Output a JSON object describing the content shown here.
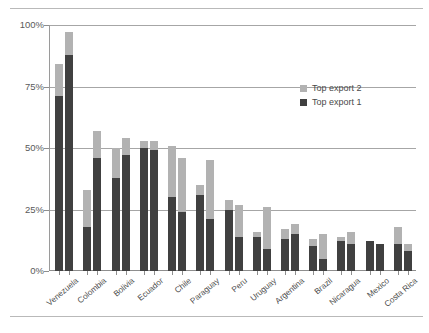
{
  "chart_data": {
    "type": "bar",
    "title": "",
    "subtitle": "",
    "xlabel": "",
    "ylabel": "",
    "ylim": [
      0,
      100
    ],
    "y_tick_labels": [
      "0%",
      "25%",
      "50%",
      "75%",
      "100%"
    ],
    "y_ticks": [
      0,
      25,
      50,
      75,
      100
    ],
    "grid": "horizontal",
    "stacked": true,
    "bars_per_category": 2,
    "legend_position": "inside-top-right",
    "legend": [
      "Top export 2",
      "Top export 1"
    ],
    "colors": {
      "top_export_1": "#404040",
      "top_export_2": "#b2b2b2",
      "gridline": "#a6a6a6",
      "axis": "#8e8e8e",
      "text": "#4a4a4a",
      "background": "#ffffff"
    },
    "categories": [
      "Venezuela",
      "Colombia",
      "Bolivia",
      "Ecuador",
      "Chile",
      "Paraguay",
      "Peru",
      "Uruguay",
      "Argentina",
      "Brazil",
      "Nicaragua",
      "Mexico",
      "Costa Rica"
    ],
    "series": [
      {
        "name": "Top export 1",
        "bar_a": [
          71,
          18,
          38,
          50,
          30,
          31,
          25,
          14,
          13,
          10,
          12,
          12,
          11
        ],
        "bar_b": [
          88,
          46,
          47,
          49,
          24,
          21,
          14,
          9,
          15,
          5,
          11,
          11,
          8
        ]
      },
      {
        "name": "Top export 2",
        "bar_a": [
          13,
          15,
          12,
          3,
          21,
          4,
          4,
          2,
          4,
          3,
          2,
          0,
          7
        ],
        "bar_b": [
          9,
          11,
          7,
          4,
          22,
          24,
          13,
          17,
          4,
          10,
          5,
          0,
          3
        ]
      }
    ],
    "totals": {
      "bar_a": [
        84,
        33,
        50,
        53,
        51,
        35,
        29,
        16,
        17,
        13,
        14,
        12,
        18
      ],
      "bar_b": [
        97,
        57,
        54,
        53,
        46,
        45,
        27,
        26,
        19,
        15,
        16,
        11,
        11
      ]
    }
  }
}
